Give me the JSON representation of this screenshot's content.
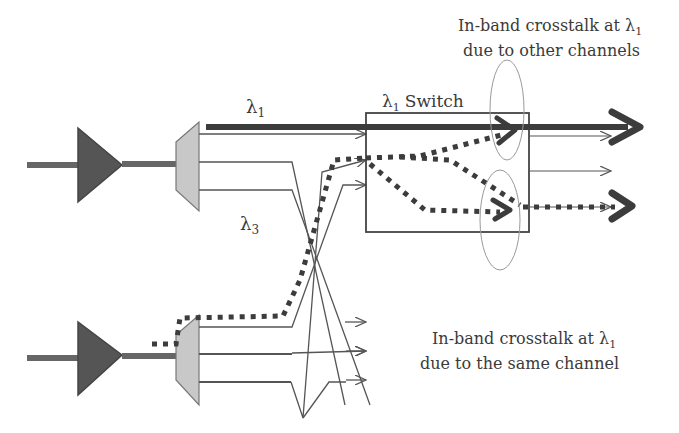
{
  "diagram": {
    "labels": {
      "lambda1": "λ",
      "lambda1_sub": "1",
      "lambda3": "λ",
      "lambda3_sub": "3",
      "switch": "Switch",
      "switch_lambda": "λ",
      "switch_sub": "1"
    },
    "annotations": {
      "top_line1": "In-band crosstalk at λ",
      "top_line1_sub": "1",
      "top_line2": "due to other channels",
      "bottom_line1": "In-band crosstalk at λ",
      "bottom_line1_sub": "1",
      "bottom_line2": "due to the same channel"
    },
    "components": [
      {
        "name": "amplifier-top",
        "type": "optical-amplifier"
      },
      {
        "name": "demux-top",
        "type": "demultiplexer"
      },
      {
        "name": "amplifier-bottom",
        "type": "optical-amplifier"
      },
      {
        "name": "demux-bottom",
        "type": "demultiplexer"
      },
      {
        "name": "lambda1-switch",
        "type": "optical-switch"
      }
    ],
    "colors": {
      "amplifier": "#555555",
      "demux": "#c8c8c8",
      "line": "#444444",
      "thick": "#3c3c3c",
      "ellipse": "#9a9a9a"
    }
  }
}
